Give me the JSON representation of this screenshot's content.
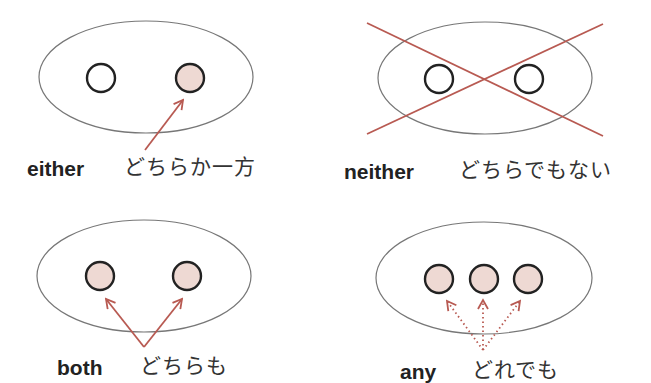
{
  "colors": {
    "background": "#ffffff",
    "ellipse_stroke": "#777777",
    "circle_stroke": "#222222",
    "circle_fill_selected": "#eed9d3",
    "circle_fill_empty": "#ffffff",
    "arrow": "#b85a52",
    "text": "#222222"
  },
  "panels": [
    {
      "id": "either",
      "word": "either",
      "meaning": "どちらか一方",
      "circles": 2,
      "selected": [
        2
      ],
      "marker": "solid-arrow-to-one"
    },
    {
      "id": "neither",
      "word": "neither",
      "meaning": "どちらでもない",
      "circles": 2,
      "selected": [],
      "marker": "cross-out"
    },
    {
      "id": "both",
      "word": "both",
      "meaning": "どちらも",
      "circles": 2,
      "selected": [
        1,
        2
      ],
      "marker": "solid-arrows-to-both"
    },
    {
      "id": "any",
      "word": "any",
      "meaning": "どれでも",
      "circles": 3,
      "selected": [
        1,
        2,
        3
      ],
      "marker": "dotted-arrows-to-all"
    }
  ]
}
